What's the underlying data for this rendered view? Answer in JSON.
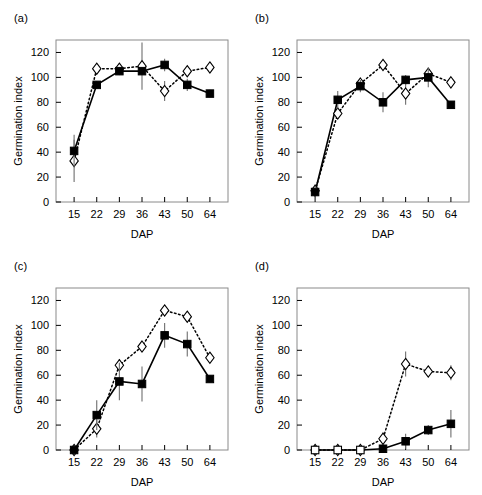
{
  "figure": {
    "width": 482,
    "height": 495,
    "background": "#ffffff"
  },
  "axes": {
    "xlabel": "DAP",
    "ylabel": "Germination index",
    "xticks": [
      15,
      22,
      29,
      36,
      43,
      50,
      64
    ],
    "yticks": [
      0,
      20,
      40,
      60,
      80,
      100,
      120
    ],
    "ylim": [
      0,
      130
    ],
    "grid": false
  },
  "legend": {
    "position": "none",
    "entries": [
      {
        "name": "filled-square-solid",
        "marker": "filled-square",
        "line": "solid"
      },
      {
        "name": "open-diamond-dotted",
        "marker": "open-diamond",
        "line": "dotted"
      }
    ]
  },
  "panels": [
    {
      "id": "a",
      "label": "(a)"
    },
    {
      "id": "b",
      "label": "(b)"
    },
    {
      "id": "c",
      "label": "(c)"
    },
    {
      "id": "d",
      "label": "(d)"
    }
  ],
  "chart_data": [
    {
      "type": "line",
      "panel": "(a)",
      "title": "",
      "xlabel": "DAP",
      "ylabel": "Germination index",
      "x": [
        15,
        22,
        29,
        36,
        43,
        50,
        64
      ],
      "xlim": [
        10,
        69
      ],
      "ylim": [
        0,
        130
      ],
      "grid": false,
      "series": [
        {
          "name": "filled-square-solid",
          "marker": "filled-square",
          "line": "solid",
          "values": [
            41,
            94,
            105,
            105,
            110,
            94,
            87
          ],
          "errors": [
            13,
            3,
            3,
            3,
            5,
            5,
            3
          ]
        },
        {
          "name": "open-diamond-dotted",
          "marker": "open-diamond",
          "line": "dotted",
          "values": [
            33,
            107,
            107,
            109,
            89,
            105,
            108
          ],
          "errors": [
            17,
            3,
            4,
            19,
            8,
            3,
            3
          ]
        }
      ]
    },
    {
      "type": "line",
      "panel": "(b)",
      "title": "",
      "xlabel": "DAP",
      "ylabel": "Germination index",
      "x": [
        15,
        22,
        29,
        36,
        43,
        50,
        64
      ],
      "xlim": [
        10,
        69
      ],
      "ylim": [
        0,
        130
      ],
      "grid": false,
      "series": [
        {
          "name": "filled-square-solid",
          "marker": "filled-square",
          "line": "solid",
          "values": [
            8,
            82,
            93,
            80,
            98,
            100,
            78
          ],
          "errors": [
            4,
            7,
            5,
            8,
            4,
            8,
            3
          ]
        },
        {
          "name": "open-diamond-dotted",
          "marker": "open-diamond",
          "line": "dotted",
          "values": [
            9,
            71,
            95,
            110,
            87,
            103,
            96
          ],
          "errors": [
            5,
            4,
            4,
            4,
            9,
            3,
            3
          ]
        }
      ]
    },
    {
      "type": "line",
      "panel": "(c)",
      "title": "",
      "xlabel": "DAP",
      "ylabel": "Germination index",
      "x": [
        15,
        22,
        29,
        36,
        43,
        50,
        64
      ],
      "xlim": [
        10,
        69
      ],
      "ylim": [
        0,
        130
      ],
      "grid": false,
      "series": [
        {
          "name": "filled-square-solid",
          "marker": "filled-square",
          "line": "solid",
          "values": [
            0,
            28,
            55,
            53,
            92,
            85,
            57
          ],
          "errors": [
            1,
            12,
            15,
            14,
            10,
            10,
            3
          ]
        },
        {
          "name": "open-diamond-dotted",
          "marker": "open-diamond",
          "line": "dotted",
          "values": [
            0,
            17,
            68,
            83,
            112,
            107,
            74
          ],
          "errors": [
            1,
            7,
            5,
            4,
            4,
            3,
            4
          ]
        }
      ]
    },
    {
      "type": "line",
      "panel": "(d)",
      "title": "",
      "xlabel": "DAP",
      "ylabel": "Germination index",
      "x": [
        15,
        22,
        29,
        36,
        43,
        50,
        64
      ],
      "xlim": [
        10,
        69
      ],
      "ylim": [
        0,
        130
      ],
      "grid": false,
      "series": [
        {
          "name": "filled-square-solid",
          "marker": "filled-square",
          "line": "solid",
          "values": [
            0,
            0,
            0,
            1,
            7,
            16,
            21
          ],
          "errors": [
            0,
            0,
            0,
            1,
            6,
            4,
            11
          ]
        },
        {
          "name": "open-diamond-dotted",
          "marker": "open-diamond",
          "line": "dotted",
          "values": [
            0,
            0,
            0,
            9,
            69,
            63,
            62
          ],
          "errors": [
            0,
            0,
            0,
            5,
            10,
            4,
            6
          ]
        }
      ]
    }
  ]
}
